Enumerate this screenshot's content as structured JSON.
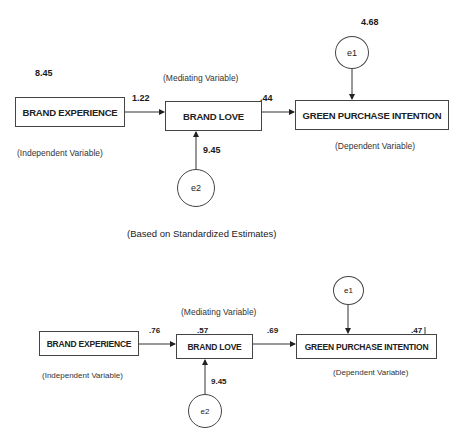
{
  "caption": "(Based on Standardized Estimates)",
  "top_model": {
    "nodes": {
      "brand_experience": {
        "label": "BRAND EXPERIENCE",
        "role": "(Independent  Variable)",
        "variance": "8.45"
      },
      "brand_love": {
        "label": "BRAND LOVE",
        "role": "(Mediating  Variable)"
      },
      "green_purchase_intention": {
        "label": "GREEN PURCHASE INTENTION",
        "role": "(Dependent  Variable)"
      },
      "e1": {
        "label": "e1",
        "value": "4.68"
      },
      "e2": {
        "label": "e2",
        "value": "9.45"
      }
    },
    "paths": {
      "be_to_bl": "1.22",
      "bl_to_gpi": ".44"
    }
  },
  "bottom_model": {
    "nodes": {
      "brand_experience": {
        "label": "BRAND EXPERIENCE",
        "role": "(Independent  Variable)"
      },
      "brand_love": {
        "label": "BRAND LOVE",
        "role": "(Mediating  Variable)",
        "r_squared": ".57"
      },
      "green_purchase_intention": {
        "label": "GREEN PURCHASE INTENTION",
        "role": "(Dependent  Variable)",
        "r_squared": ".47"
      },
      "e1": {
        "label": "e1"
      },
      "e2": {
        "label": "e2",
        "value": "9.45"
      }
    },
    "paths": {
      "be_to_bl": ".76",
      "bl_to_gpi": ".69"
    }
  },
  "colors": {
    "line": "#333333",
    "text": "#222222",
    "background": "#ffffff"
  }
}
